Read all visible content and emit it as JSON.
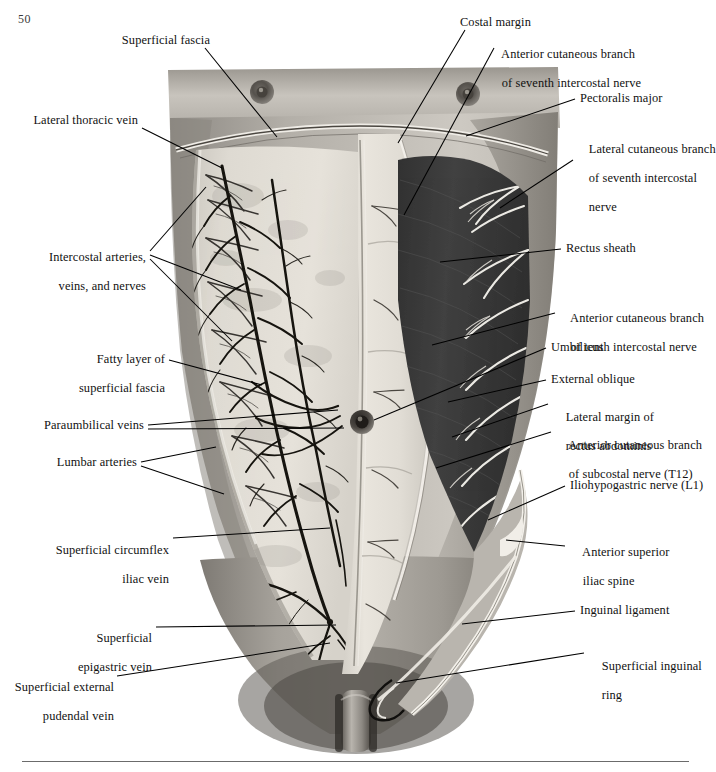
{
  "page": {
    "number": "50",
    "type": "anatomical-illustration"
  },
  "figure": {
    "view": "anterior",
    "left_half": "superficial fascia reflected showing cutaneous veins and intercostal neurovascular bundles",
    "right_half": "external oblique aponeurosis and muscle reflected showing rectus sheath and cutaneous nerves",
    "colors": {
      "skin_light": "#cfcbc4",
      "fascia_pale": "#ddd9d2",
      "rectus_sheath": "#e2ded6",
      "external_oblique_dark": "#3c3c3c",
      "vein_dark": "#1e1e1e",
      "nerve_pale": "#efece6",
      "leader_line": "#000000",
      "background": "#ffffff"
    }
  },
  "labels": {
    "left": [
      {
        "id": "superficial-fascia",
        "text": "Superficial fascia",
        "lines": [
          "Superficial fascia"
        ]
      },
      {
        "id": "lateral-thoracic-vein",
        "text": "Lateral thoracic vein",
        "lines": [
          "Lateral thoracic vein"
        ]
      },
      {
        "id": "intercostal-arteries-veins-nerves",
        "text": "Intercostal arteries, veins, and nerves",
        "lines": [
          "Intercostal arteries,",
          "veins, and nerves"
        ]
      },
      {
        "id": "fatty-layer-of-superficial-fascia",
        "text": "Fatty layer of superficial fascia",
        "lines": [
          "Fatty layer of",
          "superficial fascia"
        ]
      },
      {
        "id": "paraumbilical-veins",
        "text": "Paraumbilical veins",
        "lines": [
          "Paraumbilical veins"
        ]
      },
      {
        "id": "lumbar-arteries",
        "text": "Lumbar arteries",
        "lines": [
          "Lumbar arteries"
        ]
      },
      {
        "id": "superficial-circumflex-iliac-vein",
        "text": "Superficial circumflex iliac vein",
        "lines": [
          "Superficial circumflex",
          "iliac vein"
        ]
      },
      {
        "id": "superficial-epigastric-vein",
        "text": "Superficial epigastric vein",
        "lines": [
          "Superficial",
          "epigastric vein"
        ]
      },
      {
        "id": "superficial-external-pudendal-vein",
        "text": "Superficial external pudendal vein",
        "lines": [
          "Superficial external",
          "pudendal vein"
        ]
      }
    ],
    "right": [
      {
        "id": "costal-margin",
        "text": "Costal margin",
        "lines": [
          "Costal margin"
        ]
      },
      {
        "id": "anterior-cutaneous-branch-seventh-intercostal-nerve",
        "text": "Anterior cutaneous branch of seventh intercostal nerve",
        "lines": [
          "Anterior cutaneous branch",
          "of seventh intercostal nerve"
        ]
      },
      {
        "id": "pectoralis-major",
        "text": "Pectoralis major",
        "lines": [
          "Pectoralis major"
        ]
      },
      {
        "id": "lateral-cutaneous-branch-seventh-intercostal-nerve",
        "text": "Lateral cutaneous branch of seventh intercostal nerve",
        "lines": [
          "Lateral cutaneous branch",
          "of seventh intercostal",
          "nerve"
        ]
      },
      {
        "id": "rectus-sheath",
        "text": "Rectus sheath",
        "lines": [
          "Rectus sheath"
        ]
      },
      {
        "id": "anterior-cutaneous-branch-tenth-intercostal-nerve",
        "text": "Anterior cutaneous branch of tenth intercostal nerve",
        "lines": [
          "Anterior cutaneous branch",
          "of tenth intercostal nerve"
        ]
      },
      {
        "id": "umbilicus",
        "text": "Umbilicus",
        "lines": [
          "Umbilicus"
        ]
      },
      {
        "id": "external-oblique",
        "text": "External oblique",
        "lines": [
          "External oblique"
        ]
      },
      {
        "id": "lateral-margin-of-rectus-abdominis",
        "text": "Lateral margin of rectus abdominis",
        "lines": [
          "Lateral margin of",
          "rectus abdominis"
        ]
      },
      {
        "id": "anterior-cutaneous-branch-subcostal-nerve-t12",
        "text": "Anterior cutaneous branch of subcostal nerve (T12)",
        "lines": [
          "Anterior cutaneous branch",
          "of subcostal nerve (T12)"
        ]
      },
      {
        "id": "iliohypogastric-nerve-l1",
        "text": "Iliohypogastric nerve (L1)",
        "lines": [
          "Iliohypogastric nerve (L1)"
        ]
      },
      {
        "id": "anterior-superior-iliac-spine",
        "text": "Anterior superior iliac spine",
        "lines": [
          "Anterior superior",
          "iliac spine"
        ]
      },
      {
        "id": "inguinal-ligament",
        "text": "Inguinal ligament",
        "lines": [
          "Inguinal ligament"
        ]
      },
      {
        "id": "superficial-inguinal-ring",
        "text": "Superficial inguinal ring",
        "lines": [
          "Superficial inguinal",
          "ring"
        ]
      }
    ]
  }
}
